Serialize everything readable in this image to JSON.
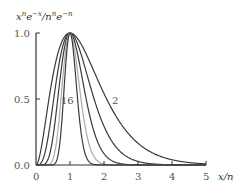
{
  "chart_data": {
    "type": "line",
    "ylabel": "x^n e^{-x}/n^n e^{-n}",
    "xlabel": "x/n",
    "xlim": [
      0,
      5
    ],
    "ylim": [
      0,
      1
    ],
    "xticks": [
      "0",
      "1",
      "2",
      "3",
      "4",
      "5"
    ],
    "yticks": [
      "0.0",
      "0.5",
      "1.0"
    ],
    "grid": false,
    "legend": "none",
    "series": [
      {
        "name": "n=2",
        "n": 2,
        "color": "#3a3a3a"
      },
      {
        "name": "n=4",
        "n": 4,
        "color": "#3a3a3a"
      },
      {
        "name": "n=8",
        "n": 8,
        "color": "#3a3a3a"
      },
      {
        "name": "n=16",
        "n": 16,
        "color": "#aaaaaa"
      },
      {
        "name": "n=32",
        "n": 32,
        "color": "#3a3a3a"
      }
    ],
    "annotations": [
      {
        "text": "16",
        "x": 0.7,
        "y": 0.38
      },
      {
        "text": "2",
        "x": 1.55,
        "y": 0.38
      }
    ]
  },
  "labels": {
    "ylabel_base": "x",
    "ylabel_sup1": "n",
    "ylabel_mid": "e",
    "ylabel_sup2": "−x",
    "ylabel_slash": "/n",
    "ylabel_sup3": "n",
    "ylabel_e2": "e",
    "ylabel_sup4": "−n",
    "xlabel": "x/n",
    "annot16": "16",
    "annot2": "2",
    "y1": "1.0",
    "y05": "0.5",
    "y0": "0.0",
    "x0": "0",
    "x1": "1",
    "x2": "2",
    "x3": "3",
    "x4": "4",
    "x5": "5"
  }
}
